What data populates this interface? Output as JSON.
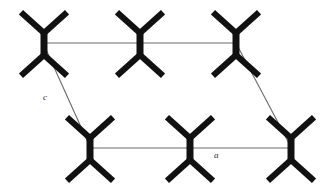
{
  "figure": {
    "kind": "crystal-packing-diagram",
    "title": "",
    "width": 334,
    "height": 193,
    "background_color": "#ffffff"
  },
  "colors": {
    "molecule_bond": "#111111",
    "unit_cell_line": "#6a6a6a",
    "axis_label_text": "#2b2b2b"
  },
  "style": {
    "bond_stroke_width": 6.2,
    "central_bond_stroke_width": 7.0,
    "unit_cell_stroke_width": 1.1,
    "arm_length": 31,
    "arm_angle_deg": 42,
    "central_bond_length": 22
  },
  "molecules": [
    {
      "id": "mol-top-left",
      "label": "ethane-like-molecule",
      "cx": 44,
      "cy": 44,
      "row": "top",
      "column": 1
    },
    {
      "id": "mol-top-center",
      "label": "ethane-like-molecule",
      "cx": 140,
      "cy": 44,
      "row": "top",
      "column": 2
    },
    {
      "id": "mol-top-right",
      "label": "ethane-like-molecule",
      "cx": 236,
      "cy": 44,
      "row": "top",
      "column": 3
    },
    {
      "id": "mol-bottom-left",
      "label": "ethane-like-molecule",
      "cx": 90,
      "cy": 149,
      "row": "bottom",
      "column": 1
    },
    {
      "id": "mol-bottom-center",
      "label": "ethane-like-molecule",
      "cx": 190,
      "cy": 149,
      "row": "bottom",
      "column": 2
    },
    {
      "id": "mol-bottom-right",
      "label": "ethane-like-molecule",
      "cx": 291,
      "cy": 149,
      "row": "bottom",
      "column": 3
    }
  ],
  "unit_cell": {
    "edges": [
      {
        "id": "edge-top-a",
        "name": "unit-cell-edge-top",
        "x1": 43,
        "y1": 43,
        "x2": 237,
        "y2": 43
      },
      {
        "id": "edge-bottom-a",
        "name": "unit-cell-edge-bottom",
        "x1": 90,
        "y1": 148,
        "x2": 291,
        "y2": 148
      },
      {
        "id": "edge-left-c",
        "name": "unit-cell-edge-left-diagonal",
        "x1": 44,
        "y1": 45,
        "x2": 90,
        "y2": 147
      },
      {
        "id": "edge-right-c",
        "name": "unit-cell-edge-right-diagonal",
        "x1": 237,
        "y1": 45,
        "x2": 291,
        "y2": 147
      }
    ]
  },
  "axis_labels": [
    {
      "id": "label-c",
      "text": "c",
      "x": 43,
      "y": 100,
      "axis": "c"
    },
    {
      "id": "label-a",
      "text": "a",
      "x": 214,
      "y": 158,
      "axis": "a"
    }
  ]
}
